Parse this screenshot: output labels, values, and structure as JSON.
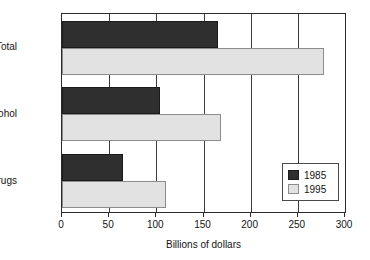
{
  "chart_data": {
    "type": "bar",
    "orientation": "horizontal",
    "title": "",
    "xlabel": "Billions of dollars",
    "ylabel": "",
    "categories": [
      "Total",
      "Alcohol",
      "Drugs"
    ],
    "series": [
      {
        "name": "1985",
        "color": "#2f2f2f",
        "values": [
          165,
          104,
          65
        ]
      },
      {
        "name": "1995",
        "color": "#e2e2e2",
        "values": [
          278,
          169,
          110
        ]
      }
    ],
    "xlim": [
      0,
      300
    ],
    "xticks": [
      0,
      50,
      100,
      150,
      200,
      250,
      300
    ],
    "xtick_labels": [
      "0",
      "50",
      "100",
      "150",
      "200",
      "250",
      "300"
    ],
    "grid": true,
    "grid_axis": "x",
    "legend_position": "lower right",
    "legend_entries": [
      "1985",
      "1995"
    ]
  }
}
